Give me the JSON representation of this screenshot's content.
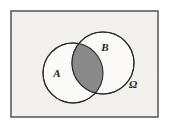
{
  "figure": {
    "kind": "venn-diagram",
    "canvas": {
      "width": 170,
      "height": 128
    },
    "page_background": "#ffffff"
  },
  "universe": {
    "name": "universe-rectangle",
    "label": "Ω",
    "label_x": 133,
    "label_y": 88,
    "label_font_size": 11,
    "rect": {
      "x": 11,
      "y": 11,
      "width": 147,
      "height": 106
    },
    "fill": "#f4f3f0",
    "stroke": "#5d5d5d",
    "stroke_width": 1.6
  },
  "sets": [
    {
      "name": "set-a",
      "label": "A",
      "cx": 73,
      "cy": 73,
      "r": 30,
      "label_x": 57,
      "label_y": 77,
      "label_font_size": 11,
      "fill": "#fbfaf8",
      "stroke": "#2a2a2a",
      "stroke_width": 1.1
    },
    {
      "name": "set-b",
      "label": "B",
      "cx": 103,
      "cy": 63,
      "r": 31,
      "label_x": 105,
      "label_y": 51,
      "label_font_size": 11,
      "fill": "#fbfaf8",
      "stroke": "#2a2a2a",
      "stroke_width": 1.1
    }
  ],
  "intersection": {
    "name": "intersection-a-and-b",
    "description": "A ∩ B",
    "fill": "#8a8a8a",
    "stroke": "#2a2a2a",
    "stroke_width": 1.1,
    "shaded": true
  },
  "colors": {
    "paper": "#f4f3f0",
    "shade_gray": "#8a8a8a",
    "ink": "#2a2a2a",
    "frame": "#5d5d5d"
  }
}
